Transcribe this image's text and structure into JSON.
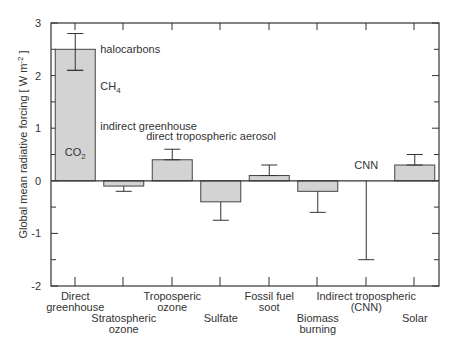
{
  "chart_data": {
    "type": "bar",
    "title": "",
    "xlabel": "",
    "ylabel": "Global mean radiative forcing [ W m⁻² ]",
    "ylabel_parts": {
      "main": "Global mean radiative forcing [ W m",
      "sup": "-2",
      "end": "]"
    },
    "ylim": [
      -2,
      3
    ],
    "yticks": [
      -2,
      -1,
      0,
      1,
      2,
      3
    ],
    "grid": false,
    "legend": null,
    "categories": [
      "Direct greenhouse",
      "Stratospheric ozone",
      "Troposperic ozone",
      "Sulfate",
      "Fossil fuel soot",
      "Biomass burning",
      "Indirect tropospheric (CNN)",
      "Solar"
    ],
    "category_label_lines": [
      [
        "Direct",
        "greenhouse"
      ],
      [
        "Stratospheric",
        "ozone"
      ],
      [
        "Troposperic",
        "ozone"
      ],
      [
        "Sulfate"
      ],
      [
        "Fossil fuel",
        "soot"
      ],
      [
        "Biomass",
        "burning"
      ],
      [
        "Indirect tropospheric",
        "(CNN)"
      ],
      [
        "Solar"
      ]
    ],
    "category_label_row": [
      0,
      1,
      0,
      1,
      0,
      1,
      0,
      1
    ],
    "values": [
      2.5,
      -0.1,
      0.4,
      -0.4,
      0.1,
      -0.2,
      null,
      0.3
    ],
    "error_high": [
      2.8,
      -0.1,
      0.6,
      -0.4,
      0.3,
      -0.2,
      0.0,
      0.5
    ],
    "error_low": [
      2.1,
      -0.2,
      0.4,
      -0.75,
      0.1,
      -0.6,
      -1.5,
      0.3
    ],
    "annotations": [
      {
        "text": "halocarbons",
        "x_cat": 0,
        "value": 2.5
      },
      {
        "text": "CH",
        "sub": "4",
        "x_cat": 0,
        "value": 1.8
      },
      {
        "text": "indirect greenhouse",
        "x_cat": 0,
        "value": 1.05
      },
      {
        "text": "CO",
        "sub": "2",
        "x_cat": 0,
        "value": 0.55,
        "inside_bar": true
      },
      {
        "text": "direct tropospheric aerosol",
        "x_cat": 2,
        "value": 0.85
      },
      {
        "text": "CNN",
        "x_cat": 6,
        "value": 0.3
      }
    ],
    "colors": {
      "bar_fill": "#d3d3d3",
      "bar_stroke": "#444444",
      "axis": "#333333",
      "text": "#333333"
    }
  }
}
